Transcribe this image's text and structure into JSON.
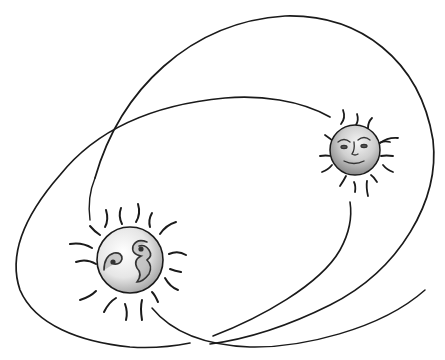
{
  "illustration": {
    "title": "Binary star orbits",
    "description": "Hand-drawn ink illustration of two smiling suns on crossing elliptical orbits",
    "colors": {
      "background": "#ffffff",
      "ink": "#1a1a1a",
      "sun_fill_light": "#f2f2f2",
      "sun_fill_dark": "#8a8a8a"
    },
    "orbits": [
      {
        "name": "outer-orbit",
        "kind": "ellipse-arc"
      },
      {
        "name": "inner-orbit",
        "kind": "ellipse-arc"
      }
    ],
    "suns": [
      {
        "name": "large-sun",
        "cx": 130,
        "cy": 260,
        "r": 33,
        "rays": 16,
        "face": "profile"
      },
      {
        "name": "small-sun",
        "cx": 355,
        "cy": 150,
        "r": 25,
        "rays": 14,
        "face": "frontal"
      }
    ]
  }
}
